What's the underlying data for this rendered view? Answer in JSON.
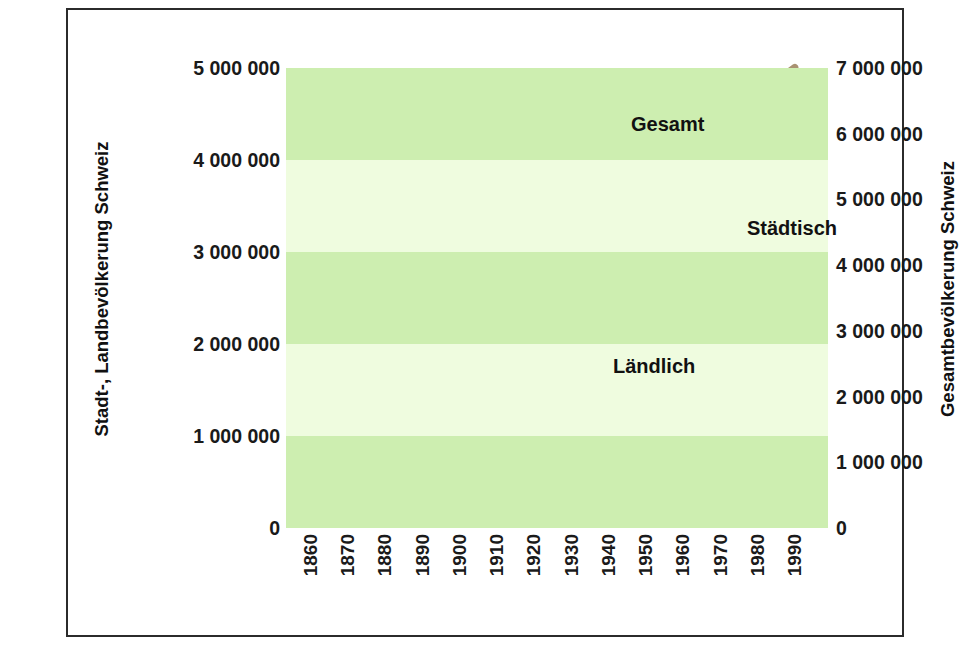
{
  "chart_data": {
    "type": "line",
    "title": "",
    "xlabel": "",
    "grid": false,
    "legend_position": "inline-annotations",
    "x": [
      1860,
      1870,
      1880,
      1890,
      1900,
      1910,
      1920,
      1930,
      1940,
      1950,
      1960,
      1970,
      1980,
      1990,
      1995
    ],
    "tick_labels_x": [
      "1860",
      "1870",
      "1880",
      "1890",
      "1900",
      "1910",
      "1920",
      "1930",
      "1940",
      "1950",
      "1960",
      "1970",
      "1980",
      "1990"
    ],
    "axes": [
      {
        "id": "left",
        "label": "Stadt-, Landbevölkerung Schweiz",
        "ylim": [
          0,
          5000000
        ],
        "ticks": [
          5000000,
          4000000,
          3000000,
          2000000,
          1000000,
          0
        ],
        "tick_labels": [
          "5 000 000",
          "4 000 000",
          "3 000 000",
          "2 000 000",
          "1 000 000",
          "0"
        ]
      },
      {
        "id": "right",
        "label": "Gesamtbevölkerung Schweiz",
        "ylim": [
          0,
          7000000
        ],
        "ticks": [
          7000000,
          6000000,
          5000000,
          4000000,
          3000000,
          2000000,
          1000000,
          0
        ],
        "tick_labels": [
          "7 000 000",
          "6 000 000",
          "5 000 000",
          "4 000 000",
          "3 000 000",
          "2 000 000",
          "1 000 000",
          "0"
        ]
      }
    ],
    "series": [
      {
        "name": "Gesamt",
        "axis": "right",
        "color": "#a99272",
        "values": [
          2510000,
          2660000,
          2830000,
          2920000,
          3320000,
          3750000,
          3880000,
          4070000,
          4270000,
          4710000,
          5430000,
          6190000,
          6330000,
          6800000,
          7010000
        ]
      },
      {
        "name": "Städtisch",
        "axis": "left",
        "color": "#fbe84b",
        "values": [
          830000,
          1000000,
          1170000,
          1340000,
          1540000,
          1760000,
          1960000,
          2140000,
          2300000,
          2640000,
          3250000,
          3860000,
          3880000,
          4420000,
          4750000
        ]
      },
      {
        "name": "Ländlich",
        "axis": "left",
        "color": "#6bc44a",
        "values": [
          1680000,
          1740000,
          1800000,
          1850000,
          1890000,
          1930000,
          1960000,
          1980000,
          1970000,
          2060000,
          2180000,
          2330000,
          2440000,
          2130000,
          2230000
        ]
      }
    ],
    "background_bands": {
      "band_color_a": "#cdeeb0",
      "band_color_b": "#effcdf",
      "band_step": 1000000,
      "axis": "left"
    }
  },
  "annotations": [
    {
      "text": "Gesamt",
      "series": "Gesamt",
      "x_px": 563,
      "y_px": 103
    },
    {
      "text": "Städtisch",
      "series": "Städtisch",
      "x_px": 679,
      "y_px": 207
    },
    {
      "text": "Ländlich",
      "series": "Ländlich",
      "x_px": 545,
      "y_px": 345
    }
  ],
  "colors": {
    "frame_border": "#2b2b2b",
    "text": "#111111",
    "gesamt": "#a99272",
    "staedtisch": "#fbe84b",
    "laendlich": "#6bc44a",
    "band_light": "#cdeeb0",
    "band_pale": "#effcdf",
    "page_background": "#ffffff"
  }
}
